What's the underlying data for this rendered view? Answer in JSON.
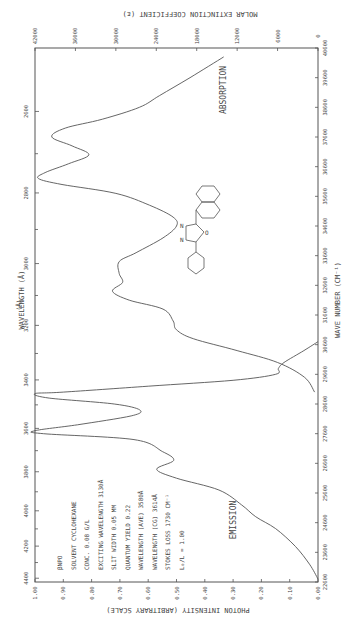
{
  "page": {
    "page_number": ""
  },
  "chart_data": {
    "type": "line",
    "compound": "βNPO",
    "xlabel": "WAVE NUMBER (CM⁻¹)",
    "secondary_xlabel": "WAVELENGTH (Å)",
    "ylabel_left": "PHOTON INTENSITY (ARBITRARY SCALE)",
    "ylabel_right": "MOLAR EXTINCTION COEFFICIENT (ε)",
    "x_range": [
      22600,
      40600
    ],
    "wave_number_ticks": [
      "40600",
      "39600",
      "38600",
      "37600",
      "36600",
      "35600",
      "34600",
      "33600",
      "32600",
      "31600",
      "30600",
      "29600",
      "28600",
      "27600",
      "26600",
      "25600",
      "24600",
      "23600",
      "22600"
    ],
    "wavelength_ticks": [
      "2600",
      "2800",
      "3000",
      "3200",
      "3400",
      "3600",
      "3800",
      "4000",
      "4200",
      "4400"
    ],
    "wavelength_unit": "(Å)",
    "intensity_ticks": [
      "1.00",
      "0.90",
      "0.80",
      "0.70",
      "0.60",
      "0.50",
      "0.40",
      "0.30",
      "0.20",
      "0.10",
      "0.00"
    ],
    "extinction_ticks": [
      "42000",
      "36000",
      "30000",
      "24000",
      "18000",
      "12000",
      "6000",
      "0"
    ],
    "grid": false,
    "series": [
      {
        "name": "ABSORPTION",
        "axis": "extinction",
        "points": [
          [
            40300,
            14000
          ],
          [
            39600,
            19000
          ],
          [
            39000,
            23500
          ],
          [
            38600,
            26500
          ],
          [
            38200,
            32000
          ],
          [
            37900,
            37500
          ],
          [
            37600,
            39500
          ],
          [
            37300,
            36500
          ],
          [
            37000,
            34000
          ],
          [
            36700,
            37000
          ],
          [
            36400,
            40500
          ],
          [
            36200,
            41500
          ],
          [
            36000,
            38000
          ],
          [
            35700,
            30000
          ],
          [
            35300,
            25000
          ],
          [
            34900,
            21500
          ],
          [
            34600,
            21000
          ],
          [
            34200,
            23000
          ],
          [
            33700,
            27000
          ],
          [
            33400,
            29500
          ],
          [
            33000,
            29500
          ],
          [
            32700,
            29000
          ],
          [
            32400,
            30500
          ],
          [
            32100,
            28000
          ],
          [
            31800,
            23000
          ],
          [
            31400,
            21500
          ],
          [
            31100,
            21000
          ],
          [
            30800,
            18500
          ],
          [
            30400,
            12000
          ],
          [
            30000,
            6000
          ],
          [
            29500,
            2000
          ],
          [
            29000,
            500
          ]
        ]
      },
      {
        "name": "EMISSION",
        "axis": "intensity",
        "points": [
          [
            30700,
            0.0
          ],
          [
            30400,
            0.05
          ],
          [
            30000,
            0.12
          ],
          [
            29800,
            0.14
          ],
          [
            29600,
            0.15
          ],
          [
            29400,
            0.3
          ],
          [
            29200,
            0.6
          ],
          [
            29000,
            0.9
          ],
          [
            28950,
            1.0
          ],
          [
            28800,
            0.95
          ],
          [
            28600,
            0.72
          ],
          [
            28400,
            0.63
          ],
          [
            28200,
            0.66
          ],
          [
            27900,
            0.85
          ],
          [
            27700,
            1.0
          ],
          [
            27600,
            0.97
          ],
          [
            27400,
            0.65
          ],
          [
            27000,
            0.55
          ],
          [
            26700,
            0.51
          ],
          [
            26400,
            0.57
          ],
          [
            26100,
            0.5
          ],
          [
            25700,
            0.35
          ],
          [
            25200,
            0.27
          ],
          [
            24800,
            0.22
          ],
          [
            24400,
            0.15
          ],
          [
            23800,
            0.08
          ],
          [
            23200,
            0.03
          ],
          [
            22700,
            0.0
          ]
        ]
      }
    ],
    "series_labels": {
      "absorption": "ABSORPTION",
      "emission": "EMISSION"
    },
    "annotations": [
      "βNPO",
      "SOLVENT CYCLOHEXANE",
      "CONC. 0.08 G/L",
      "EXCITING WAVELENGTH 3130Å",
      "SLIT WIDTH 0.05 MM",
      "QUANTUM YIELD 0.22",
      "WAVELENGTH (AVE) 3580Å",
      "WAVELENGTH (CG) 3614Å",
      "STOKES LOSS 1730 CM⁻¹",
      "L₀/L = 1.00"
    ],
    "molecule": "2-(2-naphthyl)-5-phenyl-1,3,4-oxadiazole",
    "molecule_atoms": {
      "n1": "N",
      "n2": "N",
      "o": "O"
    },
    "colors": {
      "line": "#555555",
      "background": "#ffffff"
    }
  }
}
